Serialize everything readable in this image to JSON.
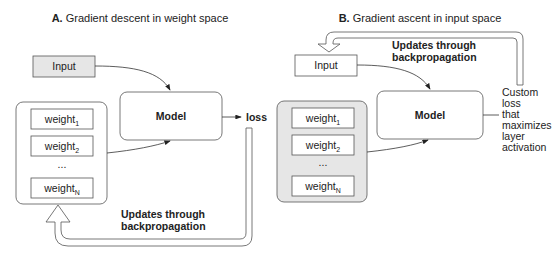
{
  "panels": [
    {
      "id": "A",
      "title_prefix": "A.",
      "title_text": " Gradient descent in weight space",
      "input_label": "Input",
      "input_fill": "#e6e6e6",
      "model_label": "Model",
      "weights_fill": "#ffffff",
      "weights": [
        {
          "base": "weight",
          "sub": "1"
        },
        {
          "base": "weight",
          "sub": "2"
        },
        {
          "base": "weight",
          "sub": "N"
        }
      ],
      "ellipsis": "...",
      "output_label": "loss",
      "update_label_line1": "Updates through",
      "update_label_line2": "backpropagation"
    },
    {
      "id": "B",
      "title_prefix": "B.",
      "title_text": " Gradient ascent in input space",
      "input_label": "Input",
      "input_fill": "#ffffff",
      "model_label": "Model",
      "weights_fill": "#e6e6e6",
      "weights": [
        {
          "base": "weight",
          "sub": "1"
        },
        {
          "base": "weight",
          "sub": "2"
        },
        {
          "base": "weight",
          "sub": "N"
        }
      ],
      "ellipsis": "...",
      "output_lines": [
        "Custom",
        "loss",
        "that",
        "maximizes",
        "layer",
        "activation"
      ],
      "update_label_line1": "Updates through",
      "update_label_line2": "backpropagation"
    }
  ],
  "colors": {
    "stroke": "#555555",
    "text": "#222222",
    "gray_fill": "#e6e6e6"
  }
}
